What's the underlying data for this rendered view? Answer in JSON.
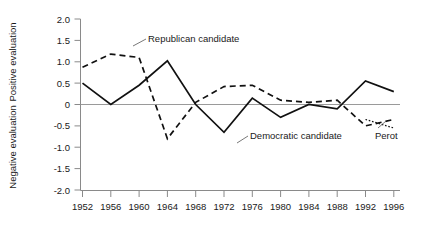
{
  "chart_data": {
    "type": "line",
    "title": "",
    "xlabel": "",
    "ylabel_positive": "Positive evaluation",
    "ylabel_negative": "Negative evaluation",
    "grid": false,
    "legend_position": "inline-annotations",
    "x": [
      1952,
      1956,
      1960,
      1964,
      1968,
      1972,
      1976,
      1980,
      1984,
      1988,
      1992,
      1996
    ],
    "categories": [
      "1952",
      "1956",
      "1960",
      "1964",
      "1968",
      "1972",
      "1976",
      "1980",
      "1984",
      "1988",
      "1992",
      "1996"
    ],
    "xlim": [
      1952,
      1996
    ],
    "ylim": [
      -2.0,
      2.0
    ],
    "yticks": [
      2.0,
      1.5,
      1.0,
      0.5,
      0,
      -0.5,
      -1.0,
      -1.5,
      -2.0
    ],
    "ytick_labels": [
      "2.0",
      "1.5",
      "1.0",
      "0.5",
      "0",
      "-0.5",
      "-1.0",
      "-1.5",
      "-2.0"
    ],
    "series": [
      {
        "name": "Republican candidate",
        "style": "dashed",
        "x": [
          1952,
          1956,
          1960,
          1964,
          1968,
          1972,
          1976,
          1980,
          1984,
          1988,
          1992,
          1996
        ],
        "values": [
          0.87,
          1.18,
          1.1,
          -0.8,
          0.05,
          0.42,
          0.45,
          0.1,
          0.05,
          0.1,
          -0.5,
          -0.35
        ]
      },
      {
        "name": "Democratic candidate",
        "style": "solid",
        "x": [
          1952,
          1956,
          1960,
          1964,
          1968,
          1972,
          1976,
          1980,
          1984,
          1988,
          1992,
          1996
        ],
        "values": [
          0.5,
          0.0,
          0.45,
          1.02,
          0.0,
          -0.65,
          0.15,
          -0.3,
          0.0,
          -0.1,
          0.55,
          0.3
        ]
      },
      {
        "name": "Perot",
        "style": "dotted",
        "x": [
          1992,
          1996
        ],
        "values": [
          -0.35,
          -0.55
        ]
      }
    ],
    "annotations": [
      {
        "text": "Republican candidate",
        "series": "Republican candidate"
      },
      {
        "text": "Democratic candidate",
        "series": "Democratic candidate"
      },
      {
        "text": "Perot",
        "series": "Perot"
      }
    ]
  },
  "axis_titles": {
    "positive": "Positive evaluation",
    "negative": "Negative evaluation"
  },
  "ytick_labels": [
    "2.0",
    "1.5",
    "1.0",
    "0.5",
    "0",
    "-0.5",
    "-1.0",
    "-1.5",
    "-2.0"
  ],
  "xtick_labels": [
    "1952",
    "1956",
    "1960",
    "1964",
    "1968",
    "1972",
    "1976",
    "1980",
    "1984",
    "1988",
    "1992",
    "1996"
  ],
  "annotations": {
    "republican": "Republican candidate",
    "democratic": "Democratic candidate",
    "perot": "Perot"
  }
}
